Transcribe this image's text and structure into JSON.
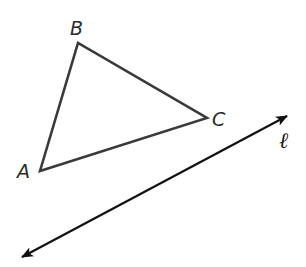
{
  "diagram": {
    "type": "geometry",
    "colors": {
      "triangle_stroke": "#3a3a3a",
      "line_stroke": "#111111",
      "label": "#2b2b2b",
      "background": "#ffffff"
    },
    "triangle": {
      "vertices": {
        "A": {
          "label": "A",
          "x": 40,
          "y": 171
        },
        "B": {
          "label": "B",
          "x": 78,
          "y": 43
        },
        "C": {
          "label": "C",
          "x": 207,
          "y": 118
        }
      }
    },
    "line": {
      "label": "ℓ",
      "start": {
        "x": 19,
        "y": 259
      },
      "end": {
        "x": 290,
        "y": 114
      },
      "arrows": "both"
    },
    "labels": {
      "A": "A",
      "B": "B",
      "C": "C",
      "l": "ℓ"
    }
  }
}
